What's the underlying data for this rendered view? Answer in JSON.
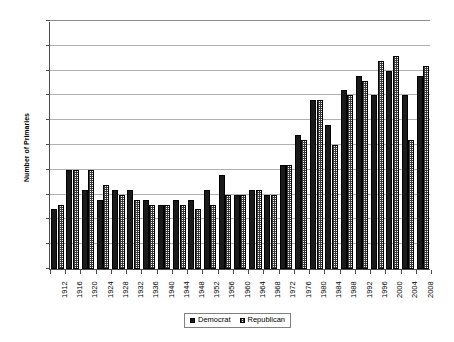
{
  "chart_data": {
    "type": "bar",
    "title": "",
    "xlabel": "",
    "ylabel": "Number of Primaries",
    "ylim": [
      0,
      50
    ],
    "ytick_step": 5,
    "yticks": [
      0,
      5,
      10,
      15,
      20,
      25,
      30,
      35,
      40,
      45,
      50
    ],
    "grid": true,
    "legend_position": "bottom-center",
    "categories": [
      "1912",
      "1916",
      "1920",
      "1924",
      "1928",
      "1932",
      "1936",
      "1940",
      "1944",
      "1948",
      "1952",
      "1956",
      "1960",
      "1964",
      "1968",
      "1972",
      "1976",
      "1980",
      "1984",
      "1988",
      "1992",
      "1996",
      "2000",
      "2004",
      "2008"
    ],
    "series": [
      {
        "name": "Democrat",
        "color": "#1a1a1a",
        "pattern": "solid",
        "values": [
          12,
          20,
          16,
          14,
          16,
          16,
          14,
          13,
          14,
          14,
          16,
          19,
          15,
          16,
          15,
          21,
          27,
          34,
          29,
          36,
          39,
          35,
          40,
          35,
          39
        ]
      },
      {
        "name": "Republican",
        "color": "#3a3a3a",
        "pattern": "checkered",
        "values": [
          13,
          20,
          20,
          17,
          15,
          14,
          13,
          13,
          13,
          12,
          13,
          15,
          15,
          16,
          15,
          21,
          26,
          34,
          25,
          35,
          38,
          42,
          43,
          26,
          41
        ]
      }
    ]
  },
  "legend": {
    "items": [
      {
        "label": "Democrat"
      },
      {
        "label": "Republican"
      }
    ]
  }
}
